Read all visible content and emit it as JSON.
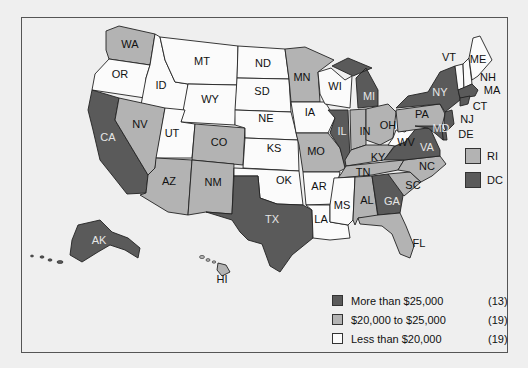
{
  "map": {
    "type": "choropleth",
    "region": "United States",
    "colors": {
      "high": "#5a5a5a",
      "mid": "#b3b3b3",
      "low": "#fbfbfb",
      "background": "#efefef",
      "border": "#555555"
    },
    "states": [
      {
        "abbr": "WA",
        "category": "mid"
      },
      {
        "abbr": "OR",
        "category": "low"
      },
      {
        "abbr": "CA",
        "category": "high"
      },
      {
        "abbr": "ID",
        "category": "low"
      },
      {
        "abbr": "NV",
        "category": "mid"
      },
      {
        "abbr": "MT",
        "category": "low"
      },
      {
        "abbr": "WY",
        "category": "low"
      },
      {
        "abbr": "UT",
        "category": "low"
      },
      {
        "abbr": "AZ",
        "category": "mid"
      },
      {
        "abbr": "CO",
        "category": "mid"
      },
      {
        "abbr": "NM",
        "category": "mid"
      },
      {
        "abbr": "ND",
        "category": "low"
      },
      {
        "abbr": "SD",
        "category": "low"
      },
      {
        "abbr": "NE",
        "category": "low"
      },
      {
        "abbr": "KS",
        "category": "low"
      },
      {
        "abbr": "OK",
        "category": "low"
      },
      {
        "abbr": "TX",
        "category": "high"
      },
      {
        "abbr": "MN",
        "category": "mid"
      },
      {
        "abbr": "IA",
        "category": "low"
      },
      {
        "abbr": "MO",
        "category": "mid"
      },
      {
        "abbr": "AR",
        "category": "low"
      },
      {
        "abbr": "LA",
        "category": "low"
      },
      {
        "abbr": "WI",
        "category": "low"
      },
      {
        "abbr": "IL",
        "category": "high"
      },
      {
        "abbr": "MI",
        "category": "high"
      },
      {
        "abbr": "IN",
        "category": "mid"
      },
      {
        "abbr": "OH",
        "category": "mid"
      },
      {
        "abbr": "KY",
        "category": "mid"
      },
      {
        "abbr": "TN",
        "category": "mid"
      },
      {
        "abbr": "MS",
        "category": "low"
      },
      {
        "abbr": "AL",
        "category": "mid"
      },
      {
        "abbr": "GA",
        "category": "high"
      },
      {
        "abbr": "FL",
        "category": "mid"
      },
      {
        "abbr": "SC",
        "category": "mid"
      },
      {
        "abbr": "NC",
        "category": "mid"
      },
      {
        "abbr": "VA",
        "category": "high"
      },
      {
        "abbr": "WV",
        "category": "low"
      },
      {
        "abbr": "PA",
        "category": "mid"
      },
      {
        "abbr": "NY",
        "category": "high"
      },
      {
        "abbr": "VT",
        "category": "low"
      },
      {
        "abbr": "NH",
        "category": "low"
      },
      {
        "abbr": "ME",
        "category": "low"
      },
      {
        "abbr": "MA",
        "category": "high"
      },
      {
        "abbr": "CT",
        "category": "high"
      },
      {
        "abbr": "RI",
        "category": "mid"
      },
      {
        "abbr": "NJ",
        "category": "high"
      },
      {
        "abbr": "DE",
        "category": "high"
      },
      {
        "abbr": "MD",
        "category": "high"
      },
      {
        "abbr": "DC",
        "category": "high"
      },
      {
        "abbr": "AK",
        "category": "high"
      },
      {
        "abbr": "HI",
        "category": "mid"
      }
    ]
  },
  "labels": {
    "WA": "WA",
    "OR": "OR",
    "CA": "CA",
    "ID": "ID",
    "NV": "NV",
    "MT": "MT",
    "WY": "WY",
    "UT": "UT",
    "AZ": "AZ",
    "CO": "CO",
    "NM": "NM",
    "ND": "ND",
    "SD": "SD",
    "NE": "NE",
    "KS": "KS",
    "OK": "OK",
    "TX": "TX",
    "MN": "MN",
    "IA": "IA",
    "MO": "MO",
    "AR": "AR",
    "LA": "LA",
    "WI": "WI",
    "IL": "IL",
    "MI": "MI",
    "IN": "IN",
    "OH": "OH",
    "KY": "KY",
    "TN": "TN",
    "MS": "MS",
    "AL": "AL",
    "GA": "GA",
    "FL": "FL",
    "SC": "SC",
    "NC": "NC",
    "VA": "VA",
    "WV": "WV",
    "PA": "PA",
    "NY": "NY",
    "VT": "VT",
    "NH": "NH",
    "ME": "ME",
    "MA": "MA",
    "CT": "CT",
    "NJ": "NJ",
    "DE": "DE",
    "MD": "MD",
    "AK": "AK",
    "HI": "HI"
  },
  "insets": {
    "ri_label": "RI",
    "dc_label": "DC"
  },
  "legend": {
    "items": [
      {
        "label": "More than $25,000",
        "count": "(13)",
        "color": "#5a5a5a"
      },
      {
        "label": "$20,000 to $25,000",
        "count": "(19)",
        "color": "#b3b3b3"
      },
      {
        "label": "Less than $20,000",
        "count": "(19)",
        "color": "#fbfbfb"
      }
    ]
  }
}
